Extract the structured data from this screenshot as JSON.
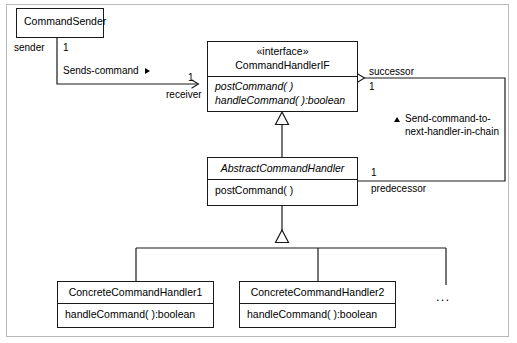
{
  "diagram": {
    "stroke_color": "#1a1a1a",
    "frame_color": "#b9b9b9",
    "background": "#ffffff"
  },
  "classes": {
    "command_sender": {
      "name": "CommandSender",
      "stereotype": "",
      "operations": []
    },
    "command_handler_if": {
      "stereotype": "«interface»",
      "name": "CommandHandlerIF",
      "operations": [
        "postCommand( )",
        "handleCommand( ):boolean"
      ]
    },
    "abstract_command_handler": {
      "name": "AbstractCommandHandler",
      "operations": [
        "postCommand( )"
      ]
    },
    "concrete_command_handler_1": {
      "name": "ConcreteCommandHandler1",
      "operations": [
        "handleCommand( ):boolean"
      ]
    },
    "concrete_command_handler_2": {
      "name": "ConcreteCommandHandler2",
      "operations": [
        "handleCommand( ):boolean"
      ]
    },
    "more_handlers_ellipsis": "..."
  },
  "associations": {
    "sends_command": {
      "label": "Sends-command",
      "direction_marker": "solid-right-triangle",
      "source_role": "sender",
      "source_multiplicity": "1",
      "target_role": "receiver",
      "target_multiplicity": "1"
    },
    "successor_link": {
      "role": "successor",
      "multiplicity": "1"
    },
    "predecessor_link": {
      "role": "predecessor",
      "multiplicity": "1"
    },
    "chain_note": {
      "marker": "solid-up-triangle",
      "line1": "Send-command-to-",
      "line2": "next-handler-in-chain"
    }
  }
}
